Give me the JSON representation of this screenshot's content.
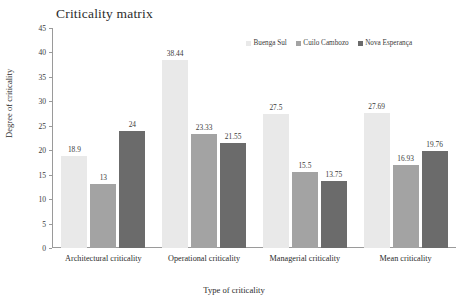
{
  "chart_data": {
    "type": "bar",
    "title": "Criticality matrix",
    "xlabel": "Type of criticality",
    "ylabel": "Degree of criticality",
    "categories": [
      "Architectural criticality",
      "Operational criticality",
      "Managerial criticality",
      "Mean criticality"
    ],
    "series": [
      {
        "name": "Buenga Sul",
        "color": "#e9e9e9",
        "values": [
          18.9,
          38.44,
          27.5,
          27.69
        ],
        "labels": [
          "18.9",
          "38.44",
          "27.5",
          "27.69"
        ]
      },
      {
        "name": "Cuilo Cambozo",
        "color": "#a3a3a3",
        "values": [
          13,
          23.33,
          15.5,
          16.93
        ],
        "labels": [
          "13",
          "23.33",
          "15.5",
          "16.93"
        ]
      },
      {
        "name": "Nova Esperança",
        "color": "#6b6b6b",
        "values": [
          24,
          21.55,
          13.75,
          19.76
        ],
        "labels": [
          "24",
          "21.55",
          "13.75",
          "19.76"
        ]
      }
    ],
    "ylim": [
      0,
      45
    ],
    "yticks": [
      0,
      5,
      10,
      15,
      20,
      25,
      30,
      35,
      40,
      45
    ],
    "ytick_labels": [
      "0",
      "5",
      "10",
      "15",
      "20",
      "25",
      "30",
      "35",
      "40",
      "45"
    ],
    "grid": false,
    "legend_position": "top-right"
  }
}
